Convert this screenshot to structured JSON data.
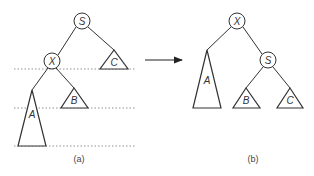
{
  "diagram": {
    "left": {
      "caption": "(a)",
      "nodes": {
        "root": "S",
        "child": "X"
      },
      "subtrees": {
        "a": "A",
        "b": "B",
        "c": "C"
      }
    },
    "right": {
      "caption": "(b)",
      "nodes": {
        "root": "X",
        "child": "S"
      },
      "subtrees": {
        "a": "A",
        "b": "B",
        "c": "C"
      }
    },
    "arrow": "right-arrow"
  }
}
